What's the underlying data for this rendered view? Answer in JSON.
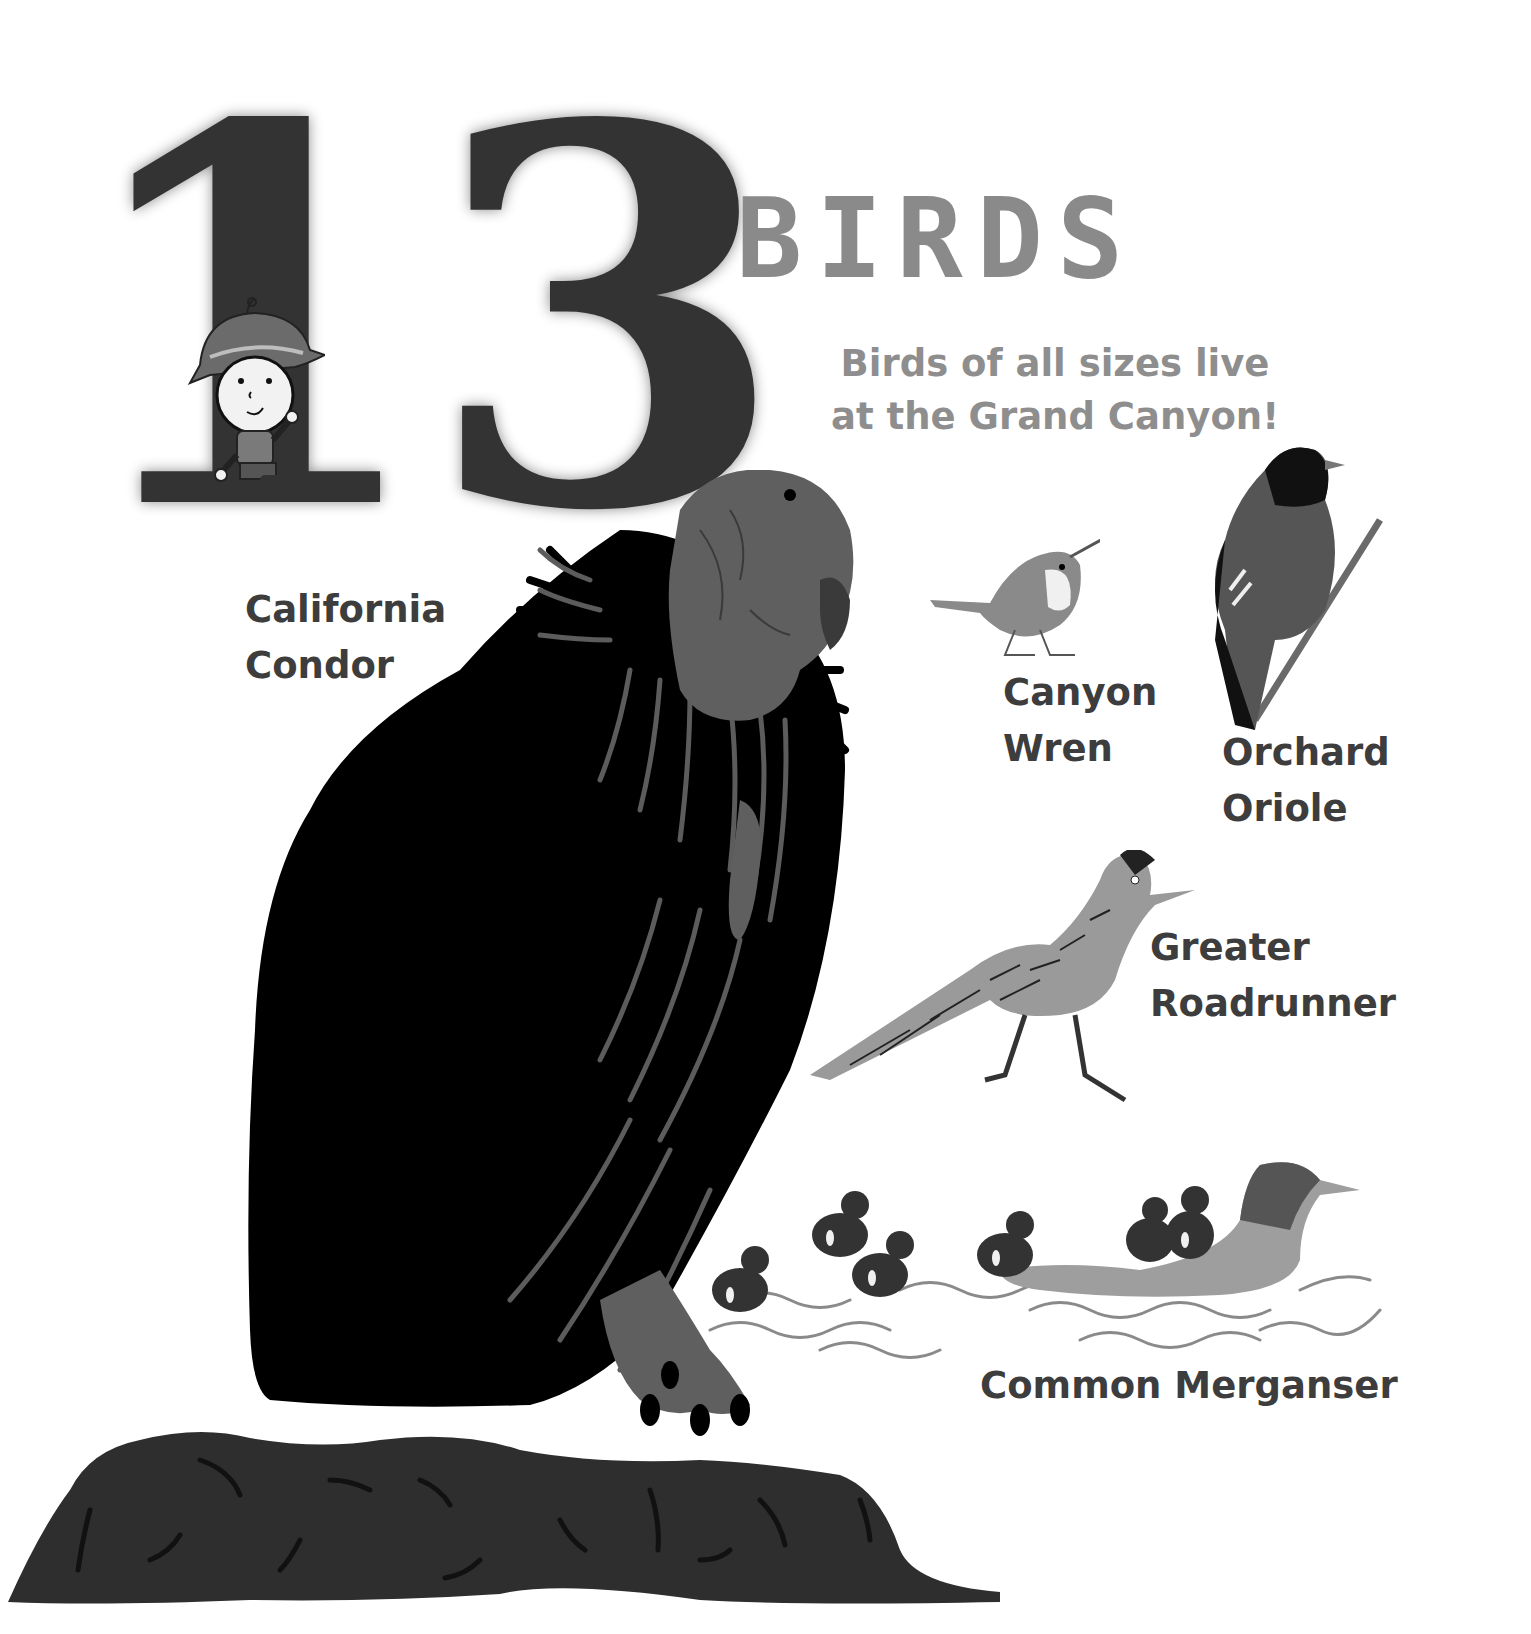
{
  "page": {
    "number": "13",
    "title": "BIRDS",
    "subtitle_lines": [
      "Birds of all sizes live",
      "at the Grand Canyon!"
    ]
  },
  "birds": [
    {
      "name_lines": [
        "California",
        "Condor"
      ]
    },
    {
      "name_lines": [
        "Canyon",
        "Wren"
      ]
    },
    {
      "name_lines": [
        "Orchard",
        "Oriole"
      ]
    },
    {
      "name_lines": [
        "Greater",
        "Roadrunner"
      ]
    },
    {
      "name_lines": [
        "Common Merganser"
      ]
    }
  ],
  "colors": {
    "number": "#333333",
    "title": "#8a8a8a",
    "subtitle": "#8e8e8e",
    "label": "#3d3d3d",
    "condor_body": "#000000",
    "condor_head": "#5f5f5f",
    "rock": "#2e2e2e"
  }
}
